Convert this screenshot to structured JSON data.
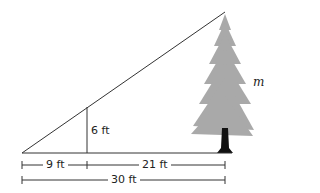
{
  "diagram": {
    "type": "similar-triangles",
    "labels": {
      "post_height": "6 ft",
      "short_base": "9 ft",
      "remaining_base": "21 ft",
      "total_base": "30 ft",
      "tree_height": "m"
    },
    "colors": {
      "line": "#333333",
      "tree": "#a9a9a9",
      "trunk": "#111111"
    }
  }
}
